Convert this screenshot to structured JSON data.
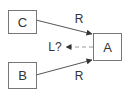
{
  "diagram": {
    "nodes": [
      {
        "id": "C",
        "label": "C"
      },
      {
        "id": "A",
        "label": "A"
      },
      {
        "id": "B",
        "label": "B"
      }
    ],
    "edges": [
      {
        "from": "C",
        "to": "A",
        "label": "R",
        "style": "solid"
      },
      {
        "from": "B",
        "to": "A",
        "label": "R",
        "style": "solid"
      },
      {
        "from": "A",
        "to": "",
        "label": "L?",
        "style": "dashed"
      }
    ]
  },
  "colors": {
    "stroke": "#777777",
    "arrow": "#333333",
    "dashed": "#999999",
    "text": "#333333"
  }
}
